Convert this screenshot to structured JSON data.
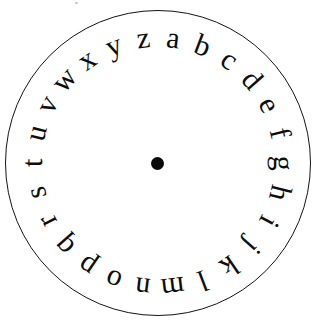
{
  "figure": {
    "name": "cipher-wheel",
    "background_color": "#ffffff",
    "ink_color": "#0d0d0d",
    "outline_color": "#141414"
  },
  "disc": {
    "center_x": 157.5,
    "center_y": 163,
    "outline_radius": 153,
    "outline_stroke_width": 1.6,
    "letter_ring_radius": 126,
    "hub_radius": 6.5,
    "hub_color": "#0a0a0a"
  },
  "alphabet": {
    "count": 26,
    "direction": "clockwise",
    "start_angle_deg": 7,
    "step_angle_deg": 13.846,
    "case": "lowercase",
    "letters": [
      {
        "char": "a",
        "index": 0,
        "angle_deg": 7
      },
      {
        "char": "b",
        "index": 1,
        "angle_deg": 20.8
      },
      {
        "char": "c",
        "index": 2,
        "angle_deg": 34.7
      },
      {
        "char": "d",
        "index": 3,
        "angle_deg": 48.5
      },
      {
        "char": "e",
        "index": 4,
        "angle_deg": 62.4
      },
      {
        "char": "f",
        "index": 5,
        "angle_deg": 76.2
      },
      {
        "char": "g",
        "index": 6,
        "angle_deg": 90.1
      },
      {
        "char": "h",
        "index": 7,
        "angle_deg": 103.9
      },
      {
        "char": "i",
        "index": 8,
        "angle_deg": 117.8
      },
      {
        "char": "j",
        "index": 9,
        "angle_deg": 131.6
      },
      {
        "char": "k",
        "index": 10,
        "angle_deg": 145.5
      },
      {
        "char": "l",
        "index": 11,
        "angle_deg": 159.3
      },
      {
        "char": "m",
        "index": 12,
        "angle_deg": 173.2
      },
      {
        "char": "n",
        "index": 13,
        "angle_deg": 187.0
      },
      {
        "char": "o",
        "index": 14,
        "angle_deg": 200.8
      },
      {
        "char": "p",
        "index": 15,
        "angle_deg": 214.7
      },
      {
        "char": "q",
        "index": 16,
        "angle_deg": 228.5
      },
      {
        "char": "r",
        "index": 17,
        "angle_deg": 242.4
      },
      {
        "char": "s",
        "index": 18,
        "angle_deg": 256.2
      },
      {
        "char": "t",
        "index": 19,
        "angle_deg": 270.1
      },
      {
        "char": "u",
        "index": 20,
        "angle_deg": 283.9
      },
      {
        "char": "v",
        "index": 21,
        "angle_deg": 297.8
      },
      {
        "char": "w",
        "index": 22,
        "angle_deg": 311.6
      },
      {
        "char": "x",
        "index": 23,
        "angle_deg": 325.5
      },
      {
        "char": "y",
        "index": 24,
        "angle_deg": 339.3
      },
      {
        "char": "z",
        "index": 25,
        "angle_deg": 353.2
      }
    ]
  },
  "artifacts": {
    "speck_color": "#c9c9c9"
  }
}
